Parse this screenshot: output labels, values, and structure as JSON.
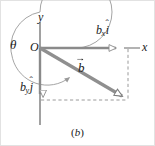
{
  "figure": {
    "caption": "(b)",
    "caption_letter": "b",
    "background_color": "#ffffff",
    "frame_color": "#e2e2e2",
    "width": 155,
    "height": 146
  },
  "labels": {
    "theta": "θ",
    "origin": "O",
    "y_axis": "y",
    "x_axis": "x",
    "vector_b": "b",
    "bx_base": "b",
    "bx_sub": "x",
    "bx_hat": "î",
    "by_base": "b",
    "by_sub": "y",
    "by_hat": "ĵ",
    "hat_mark": "ˆ",
    "i_letter": "i",
    "j_letter": "j"
  },
  "geometry": {
    "origin": {
      "x": 40,
      "y": 48
    },
    "x_axis_end": {
      "x": 140,
      "y": 48
    },
    "y_axis_top": {
      "x": 40,
      "y": 22
    },
    "y_axis_bottom": {
      "x": 40,
      "y": 125
    },
    "bx_component_tip": {
      "x": 122,
      "y": 48
    },
    "by_component_tip": {
      "x": 40,
      "y": 100
    },
    "vector_b_tip": {
      "x": 128,
      "y": 100
    },
    "arc_radius": 36,
    "arc_center": {
      "x": 40,
      "y": 48
    },
    "theta_sweep_degrees": 332
  },
  "colors": {
    "axis": "#8a8a8a",
    "vector": "#8f8f8f",
    "vector_outline": "#6f6f6f",
    "dashed": "#9a9a9a",
    "arc": "#9a9a9a",
    "text": "#1a1a1a",
    "arrow_fill": "#ffffff"
  },
  "elements": {
    "arc_name": "theta-angle-arc",
    "vector_name": "vector-b",
    "x_component_name": "x-component-arrow",
    "y_component_name": "y-component-arrow",
    "dashed_vertical_name": "projection-line-vertical",
    "dashed_horizontal_name": "projection-line-horizontal"
  }
}
